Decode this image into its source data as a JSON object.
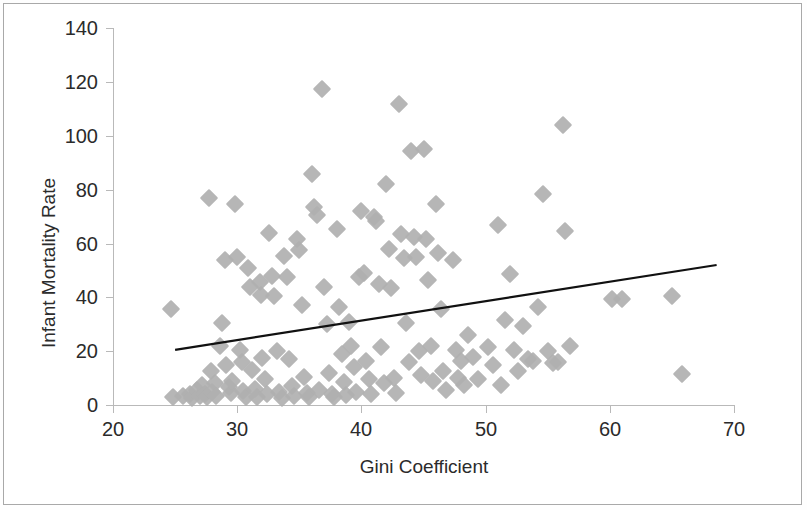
{
  "chart_data": {
    "type": "scatter",
    "title": "",
    "xlabel": "Gini Coefficient",
    "ylabel": "Infant Mortality Rate",
    "xlim": [
      20,
      70
    ],
    "ylim": [
      0,
      140
    ],
    "xticks": [
      20,
      30,
      40,
      50,
      60,
      70
    ],
    "yticks": [
      0,
      20,
      40,
      60,
      80,
      100,
      120,
      140
    ],
    "grid": false,
    "legend": null,
    "marker": {
      "shape": "diamond",
      "color": "#b0b0b0",
      "size": 13
    },
    "trendline": {
      "type": "linear",
      "color": "#111111",
      "x_start": 25.0,
      "y_start": 20.5,
      "x_end": 68.6,
      "y_end": 52.0
    },
    "series": [
      {
        "name": "Countries",
        "points": [
          [
            24.7,
            35.8
          ],
          [
            24.8,
            3.0
          ],
          [
            25.6,
            3.4
          ],
          [
            26.2,
            4.0
          ],
          [
            26.4,
            2.6
          ],
          [
            26.8,
            5.5
          ],
          [
            27.0,
            3.2
          ],
          [
            27.2,
            7.5
          ],
          [
            27.4,
            4.2
          ],
          [
            27.6,
            2.9
          ],
          [
            27.7,
            76.8
          ],
          [
            27.9,
            12.5
          ],
          [
            28.0,
            5.0
          ],
          [
            28.2,
            8.0
          ],
          [
            28.3,
            3.5
          ],
          [
            28.6,
            22.0
          ],
          [
            28.8,
            30.6
          ],
          [
            29.0,
            54.0
          ],
          [
            29.1,
            14.8
          ],
          [
            29.3,
            6.8
          ],
          [
            29.5,
            4.3
          ],
          [
            29.6,
            9.0
          ],
          [
            29.8,
            74.8
          ],
          [
            30.0,
            55.0
          ],
          [
            30.2,
            20.6
          ],
          [
            30.4,
            16.0
          ],
          [
            30.5,
            5.3
          ],
          [
            30.7,
            3.1
          ],
          [
            30.9,
            51.0
          ],
          [
            31.0,
            44.0
          ],
          [
            31.2,
            13.0
          ],
          [
            31.4,
            6.0
          ],
          [
            31.6,
            2.8
          ],
          [
            31.8,
            45.5
          ],
          [
            31.9,
            41.0
          ],
          [
            32.0,
            17.5
          ],
          [
            32.2,
            9.5
          ],
          [
            32.4,
            4.0
          ],
          [
            32.6,
            63.8
          ],
          [
            32.8,
            48.0
          ],
          [
            33.0,
            40.5
          ],
          [
            33.2,
            20.2
          ],
          [
            33.4,
            5.0
          ],
          [
            33.6,
            2.6
          ],
          [
            33.8,
            55.5
          ],
          [
            34.0,
            47.5
          ],
          [
            34.2,
            17.0
          ],
          [
            34.4,
            7.0
          ],
          [
            34.6,
            3.4
          ],
          [
            34.8,
            61.5
          ],
          [
            35.0,
            57.5
          ],
          [
            35.2,
            37.0
          ],
          [
            35.4,
            10.5
          ],
          [
            35.6,
            4.5
          ],
          [
            35.8,
            3.0
          ],
          [
            36.0,
            85.8
          ],
          [
            36.2,
            73.5
          ],
          [
            36.4,
            70.5
          ],
          [
            36.6,
            5.5
          ],
          [
            36.8,
            117.2
          ],
          [
            37.0,
            44.0
          ],
          [
            37.2,
            30.0
          ],
          [
            37.4,
            12.0
          ],
          [
            37.6,
            4.2
          ],
          [
            37.8,
            2.8
          ],
          [
            38.0,
            65.5
          ],
          [
            38.2,
            36.5
          ],
          [
            38.4,
            19.0
          ],
          [
            38.6,
            8.5
          ],
          [
            38.8,
            3.6
          ],
          [
            39.0,
            31.0
          ],
          [
            39.2,
            22.0
          ],
          [
            39.4,
            14.0
          ],
          [
            39.6,
            5.0
          ],
          [
            39.8,
            47.5
          ],
          [
            40.0,
            72.0
          ],
          [
            40.2,
            49.0
          ],
          [
            40.4,
            16.5
          ],
          [
            40.6,
            9.5
          ],
          [
            40.8,
            4.0
          ],
          [
            41.0,
            70.0
          ],
          [
            41.2,
            68.5
          ],
          [
            41.4,
            45.0
          ],
          [
            41.6,
            21.5
          ],
          [
            41.8,
            8.0
          ],
          [
            42.0,
            82.0
          ],
          [
            42.2,
            58.0
          ],
          [
            42.4,
            43.5
          ],
          [
            42.6,
            10.0
          ],
          [
            42.8,
            4.5
          ],
          [
            43.0,
            111.8
          ],
          [
            43.2,
            63.5
          ],
          [
            43.4,
            54.5
          ],
          [
            43.6,
            30.5
          ],
          [
            43.8,
            16.0
          ],
          [
            44.0,
            94.5
          ],
          [
            44.2,
            62.5
          ],
          [
            44.4,
            55.0
          ],
          [
            44.6,
            20.0
          ],
          [
            44.8,
            11.0
          ],
          [
            45.0,
            95.0
          ],
          [
            45.2,
            61.5
          ],
          [
            45.4,
            46.5
          ],
          [
            45.6,
            22.0
          ],
          [
            45.8,
            9.0
          ],
          [
            46.0,
            74.8
          ],
          [
            46.2,
            56.5
          ],
          [
            46.4,
            35.5
          ],
          [
            46.6,
            12.5
          ],
          [
            46.8,
            5.5
          ],
          [
            47.4,
            54.0
          ],
          [
            47.6,
            20.5
          ],
          [
            47.8,
            10.0
          ],
          [
            48.0,
            16.5
          ],
          [
            48.3,
            7.5
          ],
          [
            48.6,
            26.0
          ],
          [
            49.0,
            18.0
          ],
          [
            49.4,
            9.5
          ],
          [
            50.2,
            21.5
          ],
          [
            50.6,
            15.0
          ],
          [
            51.0,
            67.0
          ],
          [
            51.2,
            7.5
          ],
          [
            51.6,
            31.5
          ],
          [
            52.0,
            48.5
          ],
          [
            52.3,
            20.5
          ],
          [
            52.6,
            12.5
          ],
          [
            53.0,
            29.5
          ],
          [
            53.4,
            17.0
          ],
          [
            53.8,
            16.5
          ],
          [
            54.2,
            36.5
          ],
          [
            54.6,
            78.5
          ],
          [
            55.0,
            20.0
          ],
          [
            55.4,
            15.5
          ],
          [
            55.8,
            16.0
          ],
          [
            56.2,
            103.8
          ],
          [
            56.4,
            64.8
          ],
          [
            56.8,
            22.0
          ],
          [
            60.2,
            39.5
          ],
          [
            61.0,
            39.5
          ],
          [
            65.0,
            40.5
          ],
          [
            65.8,
            11.5
          ]
        ]
      }
    ],
    "point_count": 141
  },
  "axes": {
    "y_tick_labels": [
      "140",
      "120",
      "100",
      "80",
      "60",
      "40",
      "20",
      "0"
    ],
    "x_tick_labels": [
      "20",
      "30",
      "40",
      "50",
      "60",
      "70"
    ],
    "x_axis_title": "Gini Coefficient",
    "y_axis_title": "Infant Mortality Rate"
  },
  "colors": {
    "marker": "#b0b0b0",
    "trendline": "#111111",
    "axis": "#b9b9b9",
    "text": "#2b2b2b",
    "border": "#a9a9a9",
    "background": "#ffffff"
  }
}
